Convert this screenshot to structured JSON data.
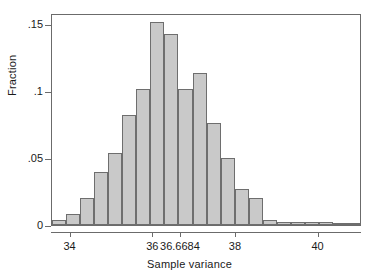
{
  "chart_data": {
    "type": "bar",
    "title": "",
    "subtitle": "",
    "xlabel": "Sample variance",
    "ylabel": "Fraction",
    "xlim": [
      33.55,
      41.05
    ],
    "ylim": [
      0,
      0.1585
    ],
    "grid": false,
    "legend": null,
    "xticks": [
      34,
      36,
      36.6684,
      38,
      40
    ],
    "xtick_labels": [
      "34",
      "36",
      "36.6684",
      "38",
      "40"
    ],
    "yticks": [
      0,
      0.05,
      0.1,
      0.15
    ],
    "ytick_labels": [
      "0",
      ".05",
      ".1",
      ".15"
    ],
    "bar_fill_color": "#c9c9c9",
    "bar_edge_color": "#6e6e6e",
    "frame_color": "#6b6b6b",
    "bin_width": 0.34,
    "bin_starts": [
      33.55,
      33.89,
      34.23,
      34.57,
      34.91,
      35.25,
      35.59,
      35.93,
      36.27,
      36.61,
      36.95,
      37.29,
      37.63,
      37.97,
      38.31,
      38.65,
      38.99,
      39.33,
      39.67,
      40.01,
      40.35,
      40.69
    ],
    "categories": [
      "33.55-33.89",
      "33.89-34.23",
      "34.23-34.57",
      "34.57-34.91",
      "34.91-35.25",
      "35.25-35.59",
      "35.59-35.93",
      "35.93-36.27",
      "36.27-36.61",
      "36.61-36.95",
      "36.95-37.29",
      "37.29-37.63",
      "37.63-37.97",
      "37.97-38.31",
      "38.31-38.65",
      "38.65-38.99",
      "38.99-39.33",
      "39.33-39.67",
      "39.67-40.01",
      "40.01-40.35",
      "40.35-40.69",
      "40.69-41.03"
    ],
    "values": [
      0.004,
      0.008,
      0.02,
      0.04,
      0.054,
      0.082,
      0.102,
      0.152,
      0.143,
      0.102,
      0.114,
      0.076,
      0.05,
      0.027,
      0.02,
      0.004,
      0.002,
      0.002,
      0.002,
      0.002,
      0.001,
      0.001
    ]
  }
}
